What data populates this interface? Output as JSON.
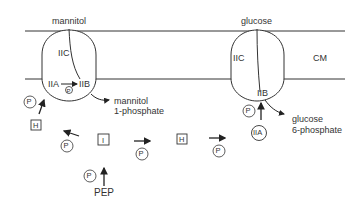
{
  "diagram": {
    "membrane_label": "CM",
    "mannitol_system": {
      "substrate": "mannitol",
      "domains": [
        "IIC",
        "IIA",
        "IIB"
      ],
      "internal_phospho": "P",
      "product_line1": "mannitol",
      "product_line2": "1-phosphate"
    },
    "glucose_system": {
      "substrate": "glucose",
      "domains": [
        "IIC",
        "IIB"
      ],
      "soluble_IIA": "IIA",
      "product_line1": "glucose",
      "product_line2": "6-phosphate"
    },
    "cascade": {
      "phospho": "P",
      "enzyme_I": "I",
      "HPr": "H",
      "donor": "PEP"
    },
    "colors": {
      "line": "#222222",
      "text": "#333333",
      "background": "#ffffff"
    }
  }
}
